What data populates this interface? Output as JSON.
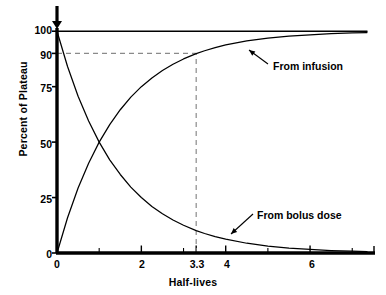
{
  "chart_data": {
    "type": "line",
    "title": "",
    "xlabel": "Half-lives",
    "ylabel": "Percent of Plateau",
    "xlim": [
      0,
      7.35
    ],
    "ylim": [
      0,
      101
    ],
    "grid": false,
    "legend": "none (inline annotations)",
    "x_ticks_major": [
      "0",
      "2",
      "3.3",
      "4",
      "6"
    ],
    "x_tick_values": [
      0,
      2,
      3.3,
      4,
      6
    ],
    "x_minor_tick_values": [
      1,
      3,
      5,
      7
    ],
    "y_ticks": [
      "0",
      "25",
      "50",
      "75",
      "90",
      "100"
    ],
    "y_tick_values": [
      0,
      25,
      50,
      75,
      90,
      100
    ],
    "series": [
      {
        "name": "From infusion",
        "formula": "100 * (1 - 2^-t)",
        "x": [
          0,
          0.25,
          0.5,
          0.75,
          1,
          1.25,
          1.5,
          1.75,
          2,
          2.25,
          2.5,
          2.75,
          3,
          3.3,
          3.5,
          3.75,
          4,
          4.5,
          5,
          5.5,
          6,
          6.5,
          7,
          7.35
        ],
        "values": [
          0,
          15.9,
          29.3,
          40.5,
          50,
          57.9,
          64.6,
          70.3,
          75,
          78.9,
          82.3,
          85.1,
          87.5,
          89.9,
          91.2,
          92.6,
          93.8,
          95.6,
          96.9,
          97.8,
          98.4,
          98.9,
          99.2,
          99.4
        ]
      },
      {
        "name": "From bolus dose",
        "formula": "100 * 2^-t",
        "x": [
          0,
          0.25,
          0.5,
          0.75,
          1,
          1.25,
          1.5,
          1.75,
          2,
          2.25,
          2.5,
          2.75,
          3,
          3.3,
          3.5,
          3.75,
          4,
          4.5,
          5,
          5.5,
          6,
          6.5,
          7,
          7.35
        ],
        "values": [
          100,
          84.1,
          70.7,
          59.5,
          50,
          42.0,
          35.4,
          29.7,
          25,
          21.0,
          17.7,
          14.9,
          12.5,
          10.1,
          8.8,
          7.4,
          6.25,
          4.4,
          3.1,
          2.2,
          1.6,
          1.1,
          0.8,
          0.6
        ]
      },
      {
        "name": "Plateau (100%)",
        "formula": "100",
        "x": [
          0,
          7.35
        ],
        "values": [
          100,
          100
        ]
      }
    ],
    "reference_lines": [
      {
        "name": "ninety-percent-guide",
        "orientation": "horizontal",
        "value": 90,
        "style": "dashed",
        "from_x": 0,
        "to_x": 3.3
      },
      {
        "name": "three-point-three-guide",
        "orientation": "vertical",
        "value": 3.3,
        "style": "dashed",
        "from_y": 0,
        "to_y": 90
      }
    ],
    "annotations": [
      {
        "name": "from-infusion-label",
        "text": "From infusion",
        "x_px": 273,
        "y_px": 66,
        "arrow_to": {
          "x_px": 249,
          "y_px": 50
        }
      },
      {
        "name": "from-bolus-dose-label",
        "text": "From bolus dose",
        "x_px": 257,
        "y_px": 218,
        "arrow_to": {
          "x_px": 231,
          "y_px": 234
        }
      },
      {
        "name": "dose-start-arrow",
        "text": "",
        "x_px": 57,
        "y_px": 6,
        "arrow_to": {
          "x_px": 57,
          "y_px": 29
        }
      }
    ]
  }
}
